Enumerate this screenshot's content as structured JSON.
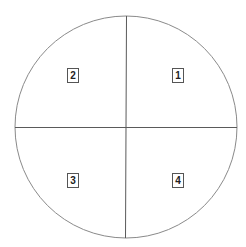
{
  "diagram": {
    "type": "quadrant-circle",
    "circle": {
      "cx": 126,
      "cy": 127,
      "r": 111,
      "stroke": "#8a8a8a"
    },
    "axes": {
      "stroke": "#5a5a5a"
    },
    "quadrants": [
      {
        "label": "1",
        "position": "top-right",
        "x": 172,
        "y": 68
      },
      {
        "label": "2",
        "position": "top-left",
        "x": 67,
        "y": 68
      },
      {
        "label": "3",
        "position": "bottom-left",
        "x": 67,
        "y": 173
      },
      {
        "label": "4",
        "position": "bottom-right",
        "x": 172,
        "y": 173
      }
    ]
  }
}
